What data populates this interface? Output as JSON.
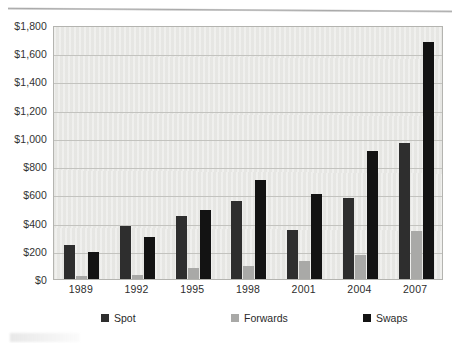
{
  "chart_data": {
    "type": "bar",
    "title": "",
    "xlabel": "",
    "ylabel": "",
    "categories": [
      "1989",
      "1992",
      "1995",
      "1998",
      "2001",
      "2004",
      "2007"
    ],
    "series": [
      {
        "name": "Spot",
        "color": "#2e2e2e",
        "values": [
          240,
          375,
          450,
          550,
          350,
          575,
          965
        ]
      },
      {
        "name": "Forwards",
        "color": "#a9a9a7",
        "values": [
          20,
          30,
          80,
          90,
          130,
          170,
          340
        ]
      },
      {
        "name": "Swaps",
        "color": "#131313",
        "values": [
          190,
          295,
          490,
          705,
          600,
          910,
          1680
        ]
      }
    ],
    "ylim": [
      0,
      1800
    ],
    "ytick_values": [
      0,
      200,
      400,
      600,
      800,
      1000,
      1200,
      1400,
      1600,
      1800
    ],
    "ytick_labels": [
      "$0",
      "$200",
      "$400",
      "$600",
      "$800",
      "$1,000",
      "$1,200",
      "$1,400",
      "$1,600",
      "$1,800"
    ],
    "grid": true,
    "legend_position": "bottom",
    "plot_background": "#e9e9e6",
    "gridline_color": "#c3c3bf",
    "axis_border_color": "#b4b4b0"
  }
}
